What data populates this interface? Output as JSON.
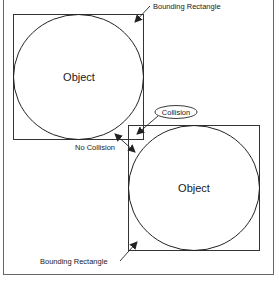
{
  "diagram": {
    "objects": [
      {
        "label": "Object"
      },
      {
        "label": "Object"
      }
    ],
    "labels": {
      "bounding_rect_top": "Bounding Rectangle",
      "bounding_rect_bottom": "Bounding Rectangle",
      "collision": "Collision",
      "no_collision": "No Collision"
    },
    "colors": {
      "stroke": "#333333",
      "frame": "#666666",
      "text": "#1a1a1a"
    }
  }
}
